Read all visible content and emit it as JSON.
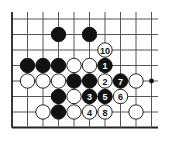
{
  "diagram": {
    "type": "go-board-fragment",
    "edges": [
      "left",
      "bottom"
    ],
    "columns": 10,
    "rows": 8,
    "colors": {
      "black": "#111111",
      "white": "#ffffff",
      "line": "#555555"
    },
    "hoshi": [
      {
        "col": 9,
        "row": 4
      }
    ],
    "stones": [
      {
        "col": 3,
        "row": 1,
        "color": "black",
        "label": ""
      },
      {
        "col": 5,
        "row": 1,
        "color": "black",
        "label": ""
      },
      {
        "col": 6,
        "row": 2,
        "color": "white",
        "label": "10"
      },
      {
        "col": 1,
        "row": 3,
        "color": "black",
        "label": ""
      },
      {
        "col": 2,
        "row": 3,
        "color": "black",
        "label": ""
      },
      {
        "col": 3,
        "row": 3,
        "color": "black",
        "label": ""
      },
      {
        "col": 4,
        "row": 3,
        "color": "white",
        "label": ""
      },
      {
        "col": 5,
        "row": 3,
        "color": "white",
        "label": ""
      },
      {
        "col": 6,
        "row": 3,
        "color": "black",
        "label": "1"
      },
      {
        "col": 1,
        "row": 4,
        "color": "white",
        "label": ""
      },
      {
        "col": 2,
        "row": 4,
        "color": "white",
        "label": ""
      },
      {
        "col": 3,
        "row": 4,
        "color": "white",
        "label": ""
      },
      {
        "col": 4,
        "row": 4,
        "color": "black",
        "label": ""
      },
      {
        "col": 5,
        "row": 4,
        "color": "black",
        "label": ""
      },
      {
        "col": 6,
        "row": 4,
        "color": "white",
        "label": "2"
      },
      {
        "col": 7,
        "row": 4,
        "color": "black",
        "label": "7"
      },
      {
        "col": 8,
        "row": 4,
        "color": "white",
        "label": ""
      },
      {
        "col": 3,
        "row": 5,
        "color": "black",
        "label": ""
      },
      {
        "col": 4,
        "row": 5,
        "color": "white",
        "label": ""
      },
      {
        "col": 5,
        "row": 5,
        "color": "black",
        "label": "3"
      },
      {
        "col": 6,
        "row": 5,
        "color": "black",
        "label": "5"
      },
      {
        "col": 7,
        "row": 5,
        "color": "white",
        "label": "6"
      },
      {
        "col": 2,
        "row": 6,
        "color": "white",
        "label": ""
      },
      {
        "col": 3,
        "row": 6,
        "color": "black",
        "label": ""
      },
      {
        "col": 4,
        "row": 6,
        "color": "white",
        "label": ""
      },
      {
        "col": 5,
        "row": 6,
        "color": "white",
        "label": "4"
      },
      {
        "col": 6,
        "row": 6,
        "color": "white",
        "label": "8"
      },
      {
        "col": 8,
        "row": 6,
        "color": "white",
        "label": ""
      }
    ]
  }
}
